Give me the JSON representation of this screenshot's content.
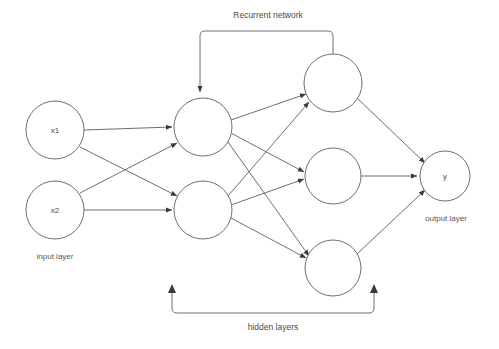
{
  "diagram": {
    "background_color": "#ffffff",
    "stroke_color": "#6f6f6f",
    "text_color": "#4a4a4a",
    "annotations": {
      "recurrent_network": "Recurrent network",
      "hidden_layers": "hidden layers",
      "input_layer": "input layer",
      "output_layer": "output layer"
    },
    "layers": [
      {
        "id": "input",
        "name": "input layer",
        "nodes": [
          {
            "id": "x1",
            "label": "x1",
            "cx": 55,
            "cy": 130,
            "r": 29
          },
          {
            "id": "x2",
            "label": "x2",
            "cx": 55,
            "cy": 210,
            "r": 29
          }
        ]
      },
      {
        "id": "hidden1",
        "name": "hidden layer 1",
        "nodes": [
          {
            "id": "h1",
            "label": "",
            "cx": 203,
            "cy": 127,
            "r": 29
          },
          {
            "id": "h2",
            "label": "",
            "cx": 203,
            "cy": 210,
            "r": 29
          }
        ]
      },
      {
        "id": "hidden2",
        "name": "hidden layer 2",
        "nodes": [
          {
            "id": "h3",
            "label": "",
            "cx": 333,
            "cy": 83,
            "r": 29
          },
          {
            "id": "h4",
            "label": "",
            "cx": 333,
            "cy": 176,
            "r": 28
          },
          {
            "id": "h5",
            "label": "",
            "cx": 333,
            "cy": 268,
            "r": 28
          }
        ]
      },
      {
        "id": "output",
        "name": "output layer",
        "nodes": [
          {
            "id": "y",
            "label": "y",
            "cx": 445,
            "cy": 176,
            "r": 25
          }
        ]
      }
    ],
    "edges": [
      {
        "from": "x1",
        "to": "h1"
      },
      {
        "from": "x1",
        "to": "h2"
      },
      {
        "from": "x2",
        "to": "h1"
      },
      {
        "from": "x2",
        "to": "h2"
      },
      {
        "from": "h1",
        "to": "h3"
      },
      {
        "from": "h1",
        "to": "h4"
      },
      {
        "from": "h1",
        "to": "h5"
      },
      {
        "from": "h2",
        "to": "h3"
      },
      {
        "from": "h2",
        "to": "h4"
      },
      {
        "from": "h2",
        "to": "h5"
      },
      {
        "from": "h3",
        "to": "y"
      },
      {
        "from": "h4",
        "to": "y"
      },
      {
        "from": "h5",
        "to": "y"
      }
    ],
    "recurrent_edge": {
      "from": "h3",
      "to": "h1",
      "routed": "top"
    }
  }
}
